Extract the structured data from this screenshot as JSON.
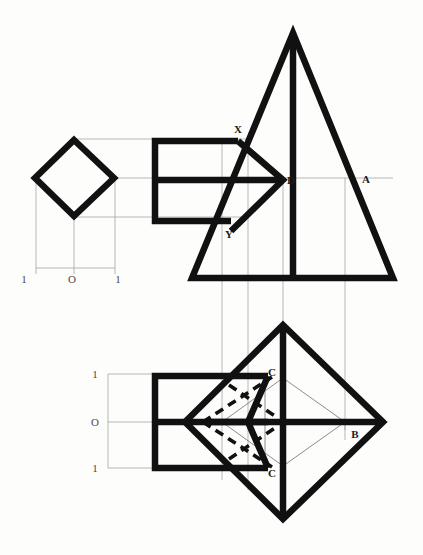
{
  "document": {
    "title": "Orthographic projection of a square pyramid with rectangular cut",
    "type": "engineering-drawing",
    "background_color": "#fdfdfc",
    "line_color": "#111111",
    "thin_line_color": "#9a9a9a"
  },
  "views": {
    "top_left": {
      "name": "auxiliary-square-view",
      "shape": "diamond"
    },
    "front": {
      "name": "front-elevation",
      "shape": "triangle-with-arrow-cut"
    },
    "plan": {
      "name": "plan-view",
      "shape": "diamond-with-arrow-cut"
    }
  },
  "point_labels": [
    {
      "id": "X",
      "text": "X",
      "x": 238,
      "y": 133
    },
    {
      "id": "D",
      "text": "D",
      "x": 285,
      "y": 180
    },
    {
      "id": "A",
      "text": "A",
      "x": 366,
      "y": 180
    },
    {
      "id": "Y",
      "text": "Y",
      "x": 229,
      "y": 234
    },
    {
      "id": "C-upper",
      "text": "C",
      "x": 272,
      "y": 375
    },
    {
      "id": "B",
      "text": "B",
      "x": 355,
      "y": 434
    },
    {
      "id": "C-lower",
      "text": "C",
      "x": 272,
      "y": 470
    }
  ],
  "scales": {
    "horizontal": {
      "name": "horizontal-scale",
      "ticks": [
        {
          "label": "1",
          "x": 24,
          "y": 279
        },
        {
          "label": "O",
          "x": 72,
          "y": 279
        },
        {
          "label": "1",
          "x": 118,
          "y": 279
        }
      ]
    },
    "vertical": {
      "name": "vertical-scale",
      "ticks": [
        {
          "label": "1",
          "x": 92,
          "y": 378
        },
        {
          "label": "O",
          "x": 92,
          "y": 423
        },
        {
          "label": "1",
          "x": 92,
          "y": 467
        }
      ]
    }
  }
}
